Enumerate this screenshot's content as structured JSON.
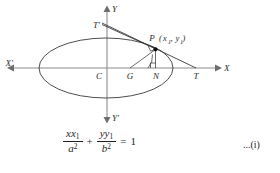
{
  "figure": {
    "title_alt": "Tangent to an ellipse at point P",
    "axes": {
      "x_positive_label": "X",
      "x_negative_label": "X'",
      "y_positive_label": "Y",
      "y_negative_label": "Y'"
    },
    "points": [
      {
        "id": "C",
        "label": "C",
        "role": "center"
      },
      {
        "id": "G",
        "label": "G",
        "role": "point-on-x-axis"
      },
      {
        "id": "N",
        "label": "N",
        "role": "foot-of-ordinate"
      },
      {
        "id": "T",
        "label": "T",
        "role": "tangent-meets-x-axis"
      },
      {
        "id": "Tprime",
        "label": "T'",
        "role": "tangent-meets-y-axis"
      },
      {
        "id": "P",
        "label": "P",
        "role": "point-on-ellipse"
      }
    ],
    "point_p_coords": {
      "open_paren": "(",
      "x_var": "x",
      "x_sub": "1",
      "comma": ", ",
      "y_var": "y",
      "y_sub": "1",
      "close_paren": ")"
    },
    "colors": {
      "axis": "#8c8c8c",
      "curve": "#3a3a3a",
      "ray": "#2e2e2e",
      "text": "#1f1f1f",
      "background": "#ffffff"
    }
  },
  "equation": {
    "term1": {
      "num_var": "xx",
      "num_sub": "1",
      "den_var": "a",
      "den_sup": "2"
    },
    "operator": "+",
    "term2": {
      "num_var": "yy",
      "num_sub": "1",
      "den_var": "b",
      "den_sup": "2"
    },
    "equals": "=",
    "rhs": "1",
    "reference": "...(i)"
  }
}
